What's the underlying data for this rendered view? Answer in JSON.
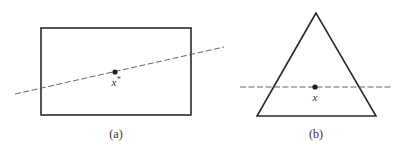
{
  "figure": {
    "panels": [
      {
        "id": "a",
        "caption": "(a)",
        "shape": "rectangle",
        "rect": {
          "x": 41,
          "y": 28,
          "width": 150,
          "height": 87
        },
        "dashed_line": {
          "x1": 15,
          "y1": 94,
          "x2": 224,
          "y2": 47
        },
        "point": {
          "x": 115,
          "y": 72,
          "label_base": "x",
          "label_sup": "*"
        }
      },
      {
        "id": "b",
        "caption": "(b)",
        "shape": "triangle",
        "triangle": {
          "apex": [
            316,
            13
          ],
          "base_left": [
            257,
            116
          ],
          "base_right": [
            376,
            116
          ]
        },
        "dashed_line": {
          "x1": 240,
          "y1": 87,
          "x2": 393,
          "y2": 87
        },
        "point": {
          "x": 315,
          "y": 87,
          "label_base": "x"
        }
      }
    ],
    "colors": {
      "stroke": "#2a2a2a",
      "dash": "#555555",
      "point": "#1e1e1e",
      "text": "#333333"
    }
  }
}
